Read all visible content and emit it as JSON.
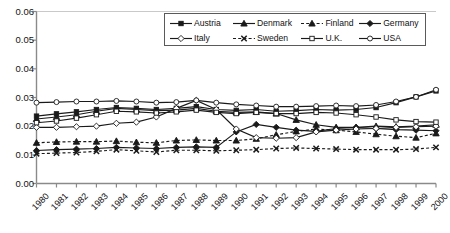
{
  "chart_data": {
    "type": "line",
    "title": "",
    "subtitle": "",
    "xlabel": "",
    "ylabel": "",
    "grid": false,
    "legend_position": "top-right",
    "xlim": [
      1980,
      2000
    ],
    "ylim": [
      0.0,
      0.06
    ],
    "ytick_labels": [
      "0.06",
      "0.05",
      "0.04",
      "0.03",
      "0.02",
      "0.01",
      "0.00"
    ],
    "ytick_values": [
      0.06,
      0.05,
      0.04,
      0.03,
      0.02,
      0.01,
      0.0
    ],
    "categories": [
      1980,
      1981,
      1982,
      1983,
      1984,
      1985,
      1986,
      1987,
      1988,
      1989,
      1990,
      1991,
      1992,
      1993,
      1994,
      1995,
      1996,
      1997,
      1998,
      1999,
      2000
    ],
    "xtick_labels": [
      "1980",
      "1981",
      "1982",
      "1983",
      "1984",
      "1985",
      "1986",
      "1987",
      "1988",
      "1989",
      "1990",
      "1991",
      "1992",
      "1993",
      "1994",
      "1995",
      "1996",
      "1997",
      "1998",
      "1999",
      "2000"
    ],
    "series": [
      {
        "name": "Austria",
        "marker": "filled-square",
        "line": "solid",
        "color": "#1a1a1a",
        "values": [
          0.0235,
          0.0243,
          0.025,
          0.0258,
          0.0265,
          0.0262,
          0.0258,
          0.0262,
          0.0268,
          0.0258,
          0.0255,
          0.0258,
          0.0252,
          0.0254,
          0.0258,
          0.0256,
          0.0258,
          0.0265,
          0.0282,
          0.0302,
          0.0323
        ]
      },
      {
        "name": "Denmark",
        "marker": "filled-triangle",
        "line": "solid",
        "color": "#1a1a1a",
        "values": [
          0.0225,
          0.0232,
          0.024,
          0.0252,
          0.0262,
          0.0258,
          0.0254,
          0.0256,
          0.0262,
          0.0252,
          0.0248,
          0.025,
          0.0244,
          0.0222,
          0.0205,
          0.0196,
          0.0196,
          0.02,
          0.0198,
          0.02,
          0.0205
        ]
      },
      {
        "name": "Finland",
        "marker": "filled-triangle",
        "line": "dashed",
        "color": "#1a1a1a",
        "values": [
          0.0142,
          0.0145,
          0.0146,
          0.0146,
          0.0148,
          0.0144,
          0.0142,
          0.015,
          0.0152,
          0.015,
          0.015,
          0.0156,
          0.017,
          0.0182,
          0.019,
          0.0186,
          0.018,
          0.0172,
          0.0165,
          0.016,
          0.0175
        ]
      },
      {
        "name": "Germany",
        "marker": "filled-diamond",
        "line": "solid",
        "color": "#1a1a1a",
        "values": [
          0.0115,
          0.0118,
          0.012,
          0.0122,
          0.0126,
          0.0124,
          0.0122,
          0.0126,
          0.0128,
          0.0126,
          0.018,
          0.0206,
          0.0196,
          0.0186,
          0.0182,
          0.0192,
          0.0196,
          0.0192,
          0.0188,
          0.0186,
          0.0184
        ]
      },
      {
        "name": "Italy",
        "marker": "open-diamond",
        "line": "solid",
        "color": "#1a1a1a",
        "values": [
          0.0196,
          0.0196,
          0.0198,
          0.02,
          0.021,
          0.0214,
          0.0232,
          0.0262,
          0.029,
          0.0258,
          0.019,
          0.016,
          0.0158,
          0.016,
          0.018,
          0.0186,
          0.019,
          0.0192,
          0.0196,
          0.0198,
          0.02
        ]
      },
      {
        "name": "Sweden",
        "marker": "x-cross",
        "line": "dashed",
        "color": "#1a1a1a",
        "values": [
          0.0104,
          0.0106,
          0.0108,
          0.0112,
          0.0118,
          0.0114,
          0.011,
          0.0116,
          0.0116,
          0.0114,
          0.0116,
          0.0118,
          0.0122,
          0.0124,
          0.0122,
          0.012,
          0.0118,
          0.0118,
          0.0118,
          0.012,
          0.0126
        ]
      },
      {
        "name": "U.K.",
        "marker": "open-square",
        "line": "solid",
        "color": "#1a1a1a",
        "values": [
          0.0212,
          0.0218,
          0.0228,
          0.024,
          0.0252,
          0.025,
          0.0246,
          0.025,
          0.0256,
          0.0248,
          0.0244,
          0.0248,
          0.0244,
          0.0244,
          0.0248,
          0.0246,
          0.024,
          0.0232,
          0.0222,
          0.0216,
          0.0214
        ]
      },
      {
        "name": "USA",
        "marker": "open-circle",
        "line": "solid",
        "color": "#1a1a1a",
        "values": [
          0.0282,
          0.0284,
          0.0286,
          0.0286,
          0.0288,
          0.0286,
          0.0282,
          0.0284,
          0.029,
          0.0282,
          0.0276,
          0.0272,
          0.0268,
          0.0268,
          0.027,
          0.0272,
          0.027,
          0.0274,
          0.0286,
          0.0302,
          0.0327
        ]
      }
    ]
  },
  "legend": {
    "rows": [
      [
        {
          "label": "Austria",
          "marker": "filled-square",
          "line": "solid"
        },
        {
          "label": "Denmark",
          "marker": "filled-triangle",
          "line": "solid"
        },
        {
          "label": "Finland",
          "marker": "filled-triangle",
          "line": "dashed"
        },
        {
          "label": "Germany",
          "marker": "filled-diamond",
          "line": "solid"
        }
      ],
      [
        {
          "label": "Italy",
          "marker": "open-diamond",
          "line": "solid"
        },
        {
          "label": "Sweden",
          "marker": "x-cross",
          "line": "dashed"
        },
        {
          "label": "U.K.",
          "marker": "open-square",
          "line": "solid"
        },
        {
          "label": "USA",
          "marker": "open-circle",
          "line": "solid"
        }
      ]
    ]
  },
  "colors": {
    "axis": "#8a8a8a",
    "ink": "#1a1a1a",
    "background": "#ffffff"
  }
}
